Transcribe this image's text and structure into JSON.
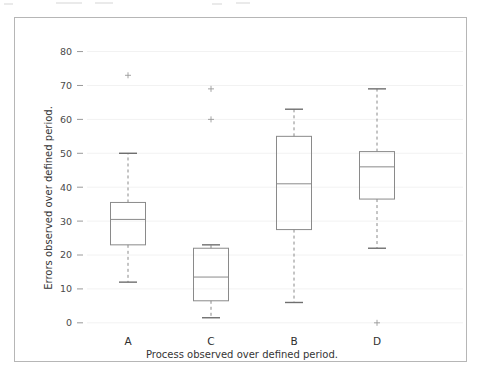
{
  "chart_data": {
    "type": "box",
    "title": "",
    "xlabel": "Process observed over defined period.",
    "ylabel": "Errors observed over defined period.",
    "categories": [
      "A",
      "C",
      "B",
      "D"
    ],
    "yticks": [
      0,
      10,
      20,
      30,
      40,
      50,
      60,
      70,
      80
    ],
    "ylim": [
      -3,
      84
    ],
    "grid": true,
    "legend": null,
    "boxes": [
      {
        "label": "A",
        "whisker_low": 12,
        "q1": 23,
        "median": 30.5,
        "q3": 35.5,
        "whisker_high": 50,
        "outliers": [
          73
        ]
      },
      {
        "label": "C",
        "whisker_low": 1.5,
        "q1": 6.5,
        "median": 13.5,
        "q3": 22,
        "whisker_high": 23,
        "outliers": [
          69,
          60
        ]
      },
      {
        "label": "B",
        "whisker_low": 6,
        "q1": 27.5,
        "median": 41,
        "q3": 55,
        "whisker_high": 63,
        "outliers": []
      },
      {
        "label": "D",
        "whisker_low": 22,
        "q1": 36.5,
        "median": 46,
        "q3": 50.5,
        "whisker_high": 69,
        "outliers": [
          0
        ]
      }
    ]
  },
  "style": {
    "box_edge_color": "#8a8a8a",
    "cap_color": "#6f6f6f",
    "grid_color": "#f2f2f2",
    "tick_label_color": "#4a4a4a",
    "frame_color": "#b6b6b6",
    "background": "#ffffff"
  },
  "ticklabels": {
    "y": [
      "80",
      "70",
      "60",
      "50",
      "40",
      "30",
      "20",
      "10",
      "0"
    ]
  }
}
